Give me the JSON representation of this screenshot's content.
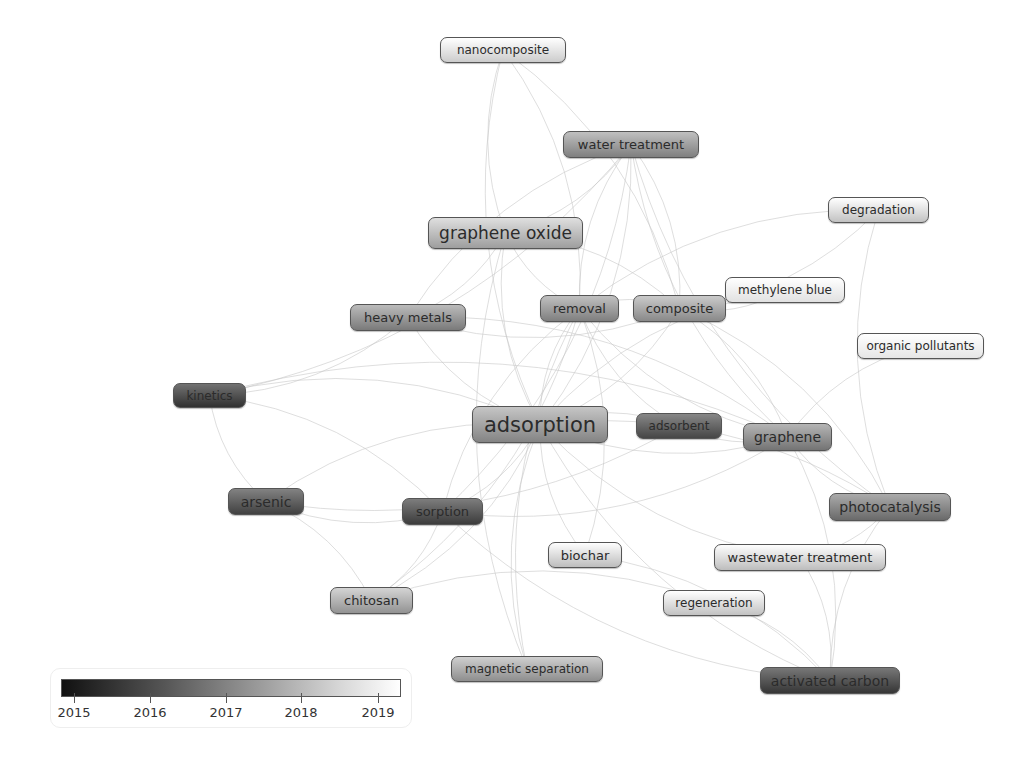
{
  "diagram": {
    "type": "keyword co-occurrence overlay network",
    "nodes": [
      {
        "id": "nanocomposite",
        "label": "nanocomposite",
        "x": 440,
        "y": 37,
        "w": 126,
        "h": 26,
        "fs": 12,
        "year": 2018.8
      },
      {
        "id": "water-treatment",
        "label": "water treatment",
        "x": 563,
        "y": 131,
        "w": 136,
        "h": 27,
        "fs": 13,
        "year": 2017.3
      },
      {
        "id": "degradation",
        "label": "degradation",
        "x": 828,
        "y": 197,
        "w": 101,
        "h": 26,
        "fs": 12,
        "year": 2018.6
      },
      {
        "id": "graphene-oxide",
        "label": "graphene oxide",
        "x": 428,
        "y": 217,
        "w": 155,
        "h": 32,
        "fs": 17,
        "year": 2017.9
      },
      {
        "id": "removal",
        "label": "removal",
        "x": 540,
        "y": 295,
        "w": 79,
        "h": 27,
        "fs": 13,
        "year": 2017.3
      },
      {
        "id": "composite",
        "label": "composite",
        "x": 633,
        "y": 295,
        "w": 93,
        "h": 27,
        "fs": 13,
        "year": 2017.5
      },
      {
        "id": "methylene-blue",
        "label": "methylene blue",
        "x": 725,
        "y": 277,
        "w": 120,
        "h": 26,
        "fs": 12,
        "year": 2019.2
      },
      {
        "id": "heavy-metals",
        "label": "heavy metals",
        "x": 350,
        "y": 304,
        "w": 116,
        "h": 27,
        "fs": 13,
        "year": 2017.2
      },
      {
        "id": "organic-pollutants",
        "label": "organic pollutants",
        "x": 857,
        "y": 333,
        "w": 127,
        "h": 26,
        "fs": 12,
        "year": 2019.3
      },
      {
        "id": "kinetics",
        "label": "kinetics",
        "x": 173,
        "y": 383,
        "w": 73,
        "h": 25,
        "fs": 12,
        "year": 2015.8
      },
      {
        "id": "adsorption",
        "label": "adsorption",
        "x": 472,
        "y": 406,
        "w": 136,
        "h": 37,
        "fs": 21,
        "year": 2017.4
      },
      {
        "id": "adsorbent",
        "label": "adsorbent",
        "x": 636,
        "y": 413,
        "w": 86,
        "h": 26,
        "fs": 12,
        "year": 2016.2
      },
      {
        "id": "graphene",
        "label": "graphene",
        "x": 743,
        "y": 423,
        "w": 89,
        "h": 28,
        "fs": 14,
        "year": 2017.1
      },
      {
        "id": "photocatalysis",
        "label": "photocatalysis",
        "x": 829,
        "y": 493,
        "w": 122,
        "h": 28,
        "fs": 14,
        "year": 2016.9
      },
      {
        "id": "arsenic",
        "label": "arsenic",
        "x": 228,
        "y": 488,
        "w": 76,
        "h": 27,
        "fs": 14,
        "year": 2016.1
      },
      {
        "id": "sorption",
        "label": "sorption",
        "x": 402,
        "y": 498,
        "w": 81,
        "h": 27,
        "fs": 13,
        "year": 2016.0
      },
      {
        "id": "biochar",
        "label": "biochar",
        "x": 548,
        "y": 542,
        "w": 74,
        "h": 26,
        "fs": 13,
        "year": 2018.5
      },
      {
        "id": "wastewater-treatment",
        "label": "wastewater treatment",
        "x": 714,
        "y": 544,
        "w": 172,
        "h": 27,
        "fs": 13,
        "year": 2018.5
      },
      {
        "id": "chitosan",
        "label": "chitosan",
        "x": 330,
        "y": 587,
        "w": 83,
        "h": 27,
        "fs": 13,
        "year": 2017.7
      },
      {
        "id": "regeneration",
        "label": "regeneration",
        "x": 663,
        "y": 590,
        "w": 102,
        "h": 26,
        "fs": 12,
        "year": 2018.6
      },
      {
        "id": "magnetic-separation",
        "label": "magnetic separation",
        "x": 451,
        "y": 656,
        "w": 152,
        "h": 26,
        "fs": 12,
        "year": 2017.6
      },
      {
        "id": "activated-carbon",
        "label": "activated carbon",
        "x": 760,
        "y": 667,
        "w": 140,
        "h": 27,
        "fs": 14,
        "year": 2015.9
      }
    ],
    "edges": [
      [
        "adsorption",
        "graphene-oxide"
      ],
      [
        "adsorption",
        "water-treatment"
      ],
      [
        "adsorption",
        "removal"
      ],
      [
        "adsorption",
        "composite"
      ],
      [
        "adsorption",
        "heavy-metals"
      ],
      [
        "adsorption",
        "kinetics"
      ],
      [
        "adsorption",
        "adsorbent"
      ],
      [
        "adsorption",
        "graphene"
      ],
      [
        "adsorption",
        "photocatalysis"
      ],
      [
        "adsorption",
        "arsenic"
      ],
      [
        "adsorption",
        "sorption"
      ],
      [
        "adsorption",
        "biochar"
      ],
      [
        "adsorption",
        "chitosan"
      ],
      [
        "adsorption",
        "magnetic-separation"
      ],
      [
        "adsorption",
        "nanocomposite"
      ],
      [
        "adsorption",
        "activated-carbon"
      ],
      [
        "adsorption",
        "methylene-blue"
      ],
      [
        "adsorption",
        "wastewater-treatment"
      ],
      [
        "water-treatment",
        "graphene-oxide"
      ],
      [
        "water-treatment",
        "removal"
      ],
      [
        "water-treatment",
        "composite"
      ],
      [
        "water-treatment",
        "heavy-metals"
      ],
      [
        "water-treatment",
        "sorption"
      ],
      [
        "water-treatment",
        "graphene"
      ],
      [
        "water-treatment",
        "kinetics"
      ],
      [
        "water-treatment",
        "photocatalysis"
      ],
      [
        "graphene-oxide",
        "heavy-metals"
      ],
      [
        "graphene-oxide",
        "removal"
      ],
      [
        "graphene-oxide",
        "composite"
      ],
      [
        "graphene-oxide",
        "magnetic-separation"
      ],
      [
        "nanocomposite",
        "removal"
      ],
      [
        "nanocomposite",
        "graphene-oxide"
      ],
      [
        "nanocomposite",
        "composite"
      ],
      [
        "kinetics",
        "arsenic"
      ],
      [
        "kinetics",
        "sorption"
      ],
      [
        "kinetics",
        "heavy-metals"
      ],
      [
        "kinetics",
        "graphene"
      ],
      [
        "arsenic",
        "sorption"
      ],
      [
        "arsenic",
        "chitosan"
      ],
      [
        "arsenic",
        "adsorbent"
      ],
      [
        "sorption",
        "chitosan"
      ],
      [
        "sorption",
        "graphene"
      ],
      [
        "sorption",
        "removal"
      ],
      [
        "sorption",
        "activated-carbon"
      ],
      [
        "biochar",
        "activated-carbon"
      ],
      [
        "biochar",
        "removal"
      ],
      [
        "regeneration",
        "activated-carbon"
      ],
      [
        "regeneration",
        "chitosan"
      ],
      [
        "wastewater-treatment",
        "activated-carbon"
      ],
      [
        "wastewater-treatment",
        "photocatalysis"
      ],
      [
        "photocatalysis",
        "graphene"
      ],
      [
        "photocatalysis",
        "activated-carbon"
      ],
      [
        "photocatalysis",
        "degradation"
      ],
      [
        "photocatalysis",
        "composite"
      ],
      [
        "graphene",
        "activated-carbon"
      ],
      [
        "graphene",
        "composite"
      ],
      [
        "degradation",
        "composite"
      ],
      [
        "degradation",
        "removal"
      ],
      [
        "methylene-blue",
        "composite"
      ],
      [
        "organic-pollutants",
        "graphene"
      ],
      [
        "adsorbent",
        "removal"
      ],
      [
        "adsorbent",
        "graphene"
      ],
      [
        "magnetic-separation",
        "removal"
      ],
      [
        "heavy-metals",
        "composite"
      ],
      [
        "heavy-metals",
        "graphene"
      ],
      [
        "chitosan",
        "removal"
      ],
      [
        "removal",
        "composite"
      ],
      [
        "removal",
        "graphene"
      ]
    ]
  },
  "legend": {
    "ticks": [
      {
        "label": "2015",
        "x": 23
      },
      {
        "label": "2016",
        "x": 99
      },
      {
        "label": "2017",
        "x": 175
      },
      {
        "label": "2018",
        "x": 250
      },
      {
        "label": "2019",
        "x": 327
      }
    ],
    "range": [
      2014.75,
      2019.3
    ]
  }
}
